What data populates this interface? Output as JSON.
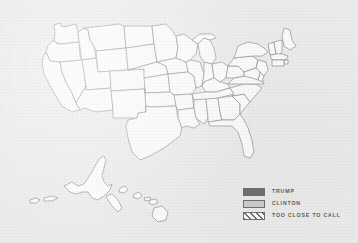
{
  "map": {
    "title": "",
    "region": "United States",
    "projection": "albers-usa",
    "background_color": "#ececed",
    "state_fill_color": "#fbfbfb",
    "state_border_color": "#8d8d8d",
    "states_shown": [
      "Washington",
      "Oregon",
      "California",
      "Nevada",
      "Idaho",
      "Montana",
      "Wyoming",
      "Utah",
      "Arizona",
      "Colorado",
      "New Mexico",
      "North Dakota",
      "South Dakota",
      "Nebraska",
      "Kansas",
      "Oklahoma",
      "Texas",
      "Minnesota",
      "Iowa",
      "Missouri",
      "Arkansas",
      "Louisiana",
      "Wisconsin",
      "Illinois",
      "Michigan",
      "Indiana",
      "Ohio",
      "Kentucky",
      "Tennessee",
      "Mississippi",
      "Alabama",
      "Georgia",
      "Florida",
      "South Carolina",
      "North Carolina",
      "Virginia",
      "West Virginia",
      "Pennsylvania",
      "New York",
      "Maine",
      "Vermont",
      "New Hampshire",
      "Massachusetts",
      "Rhode Island",
      "Connecticut",
      "New Jersey",
      "Delaware",
      "Maryland",
      "Alaska",
      "Hawaii"
    ]
  },
  "legend": {
    "items": [
      {
        "label": "TRUMP",
        "swatch": "solid-dark",
        "color": "#6e6e6e"
      },
      {
        "label": "CLINTON",
        "swatch": "solid-light",
        "color": "#c9c9c9"
      },
      {
        "label": "TOO CLOSE TO CALL",
        "swatch": "hatched",
        "color": "#6e6e6e"
      }
    ]
  }
}
